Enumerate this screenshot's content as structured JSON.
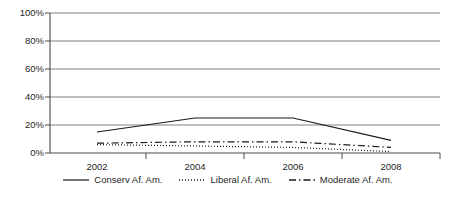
{
  "chart_data": {
    "type": "line",
    "title": "",
    "subtitle": "",
    "xlabel": "",
    "ylabel": "",
    "x": [
      2002,
      2004,
      2006,
      2008
    ],
    "categories": [
      "2002",
      "2004",
      "2006",
      "2008"
    ],
    "xtick_labels": [
      "2002",
      "2004",
      "2006",
      "2008"
    ],
    "ytick_labels": [
      "0%",
      "20%",
      "40%",
      "60%",
      "80%",
      "100%"
    ],
    "ytick_values": [
      0,
      20,
      40,
      60,
      80,
      100
    ],
    "ylim": [
      0,
      100
    ],
    "xlim": [
      2001,
      2009
    ],
    "grid": "horizontal",
    "legend_position": "bottom",
    "series": [
      {
        "name": "Conserv Af. Am.",
        "style": "solid",
        "color": "#1a1a1a",
        "values": [
          15,
          25,
          25,
          9
        ]
      },
      {
        "name": "Liberal Af. Am.",
        "style": "dotted",
        "color": "#1a1a1a",
        "values": [
          6,
          5,
          4,
          1
        ]
      },
      {
        "name": "Moderate Af. Am.",
        "style": "dashdot",
        "color": "#1a1a1a",
        "values": [
          7,
          8,
          8,
          4
        ]
      }
    ]
  },
  "axes": {
    "y_labels": [
      "100%",
      "80%",
      "60%",
      "40%",
      "20%",
      "0%"
    ],
    "x_labels": [
      "2002",
      "2004",
      "2006",
      "2008"
    ]
  },
  "legend": {
    "items": [
      {
        "label": "Conserv Af. Am.",
        "style": "solid"
      },
      {
        "label": "Liberal Af. Am.",
        "style": "dotted"
      },
      {
        "label": "Moderate Af. Am.",
        "style": "dashdot"
      }
    ]
  },
  "colors": {
    "line": "#1a1a1a",
    "grid": "#808080",
    "axis": "#4d4d4d",
    "background": "#ffffff"
  }
}
